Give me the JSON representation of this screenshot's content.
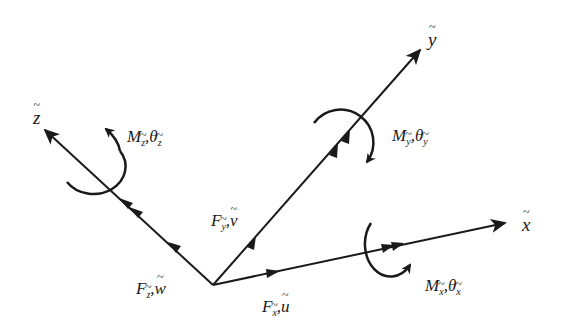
{
  "diagram": {
    "type": "3D local coordinate system with forces, moments and displacements",
    "stroke_color": "#1a1a1a",
    "background": "#ffffff",
    "origin": {
      "x": 213,
      "y": 285
    },
    "axes": [
      {
        "id": "x",
        "label": "x",
        "end": {
          "x": 505,
          "y": 223
        }
      },
      {
        "id": "y",
        "label": "y",
        "end": {
          "x": 420,
          "y": 50
        }
      },
      {
        "id": "z",
        "label": "z",
        "end": {
          "x": 45,
          "y": 130
        }
      }
    ],
    "labels": {
      "axis_x": "x",
      "axis_y": "y",
      "axis_z": "z",
      "force_x": {
        "main": "F",
        "sub": "x",
        "sep": ",",
        "disp": "u"
      },
      "force_y": {
        "main": "F",
        "sub": "y",
        "sep": ",",
        "disp": "v"
      },
      "force_z": {
        "main": "F",
        "sub": "z",
        "sep": ",",
        "disp": "w"
      },
      "moment_x": {
        "main": "M",
        "sub": "x",
        "sep": ",",
        "rot": "θ",
        "rot_sub": "x"
      },
      "moment_y": {
        "main": "M",
        "sub": "y",
        "sep": ",",
        "rot": "θ",
        "rot_sub": "y"
      },
      "moment_z": {
        "main": "M",
        "sub": "z",
        "sep": ",",
        "rot": "θ",
        "rot_sub": "z"
      }
    }
  }
}
